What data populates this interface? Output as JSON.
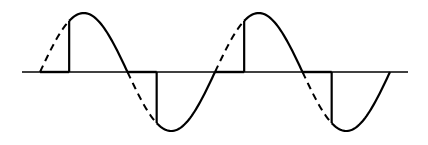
{
  "diagram": {
    "title": "",
    "colors": {
      "background": "#ffffff",
      "stroke": "#000000"
    },
    "axis": {
      "x_start": 22,
      "x_end": 408,
      "y": 72
    },
    "wave": {
      "x0": 40,
      "half_period_px": 87.5,
      "amplitude_px": 59,
      "cycles": 2,
      "firing_angle_deg": 60
    }
  }
}
